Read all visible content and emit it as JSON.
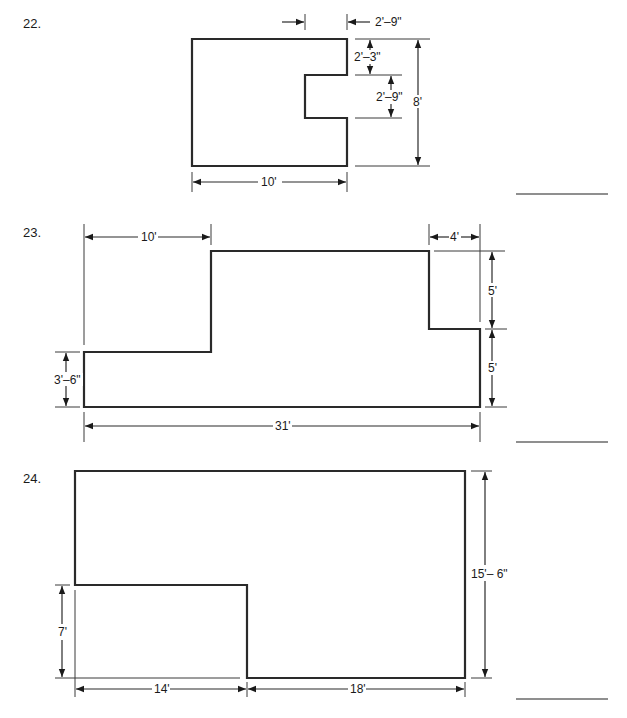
{
  "problems": [
    {
      "number": "22.",
      "dimensions": {
        "top_offset": "2'–9\"",
        "notch_top": "2'–3\"",
        "notch_height": "2'–9\"",
        "total_height": "8'",
        "width": "10'"
      },
      "answer": ""
    },
    {
      "number": "23.",
      "dimensions": {
        "left_top_width": "10'",
        "right_step_width": "4'",
        "right_upper_height": "5'",
        "right_lower_height": "5'",
        "left_height": "3'–6\"",
        "total_width": "31'"
      },
      "answer": ""
    },
    {
      "number": "24.",
      "dimensions": {
        "left_lower_height": "7'",
        "left_width": "14'",
        "right_width": "18'",
        "total_height": "15'– 6\""
      },
      "answer": ""
    }
  ],
  "colors": {
    "line": "#2a2a2a",
    "answer_line": "#6a6a6a",
    "background": "#ffffff"
  }
}
